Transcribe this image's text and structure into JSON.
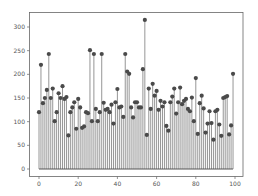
{
  "chart_data": {
    "type": "stem",
    "title": "",
    "xlabel": "",
    "ylabel": "",
    "xlim": [
      -4,
      104
    ],
    "ylim": [
      -15,
      330
    ],
    "xticks": [
      0,
      20,
      40,
      60,
      80,
      100
    ],
    "yticks": [
      0,
      50,
      100,
      150,
      200,
      250,
      300
    ],
    "grid": false,
    "legend": null,
    "baseline": 0,
    "x": [
      0,
      1,
      2,
      3,
      4,
      5,
      6,
      7,
      8,
      9,
      10,
      11,
      12,
      13,
      14,
      15,
      16,
      17,
      18,
      19,
      20,
      21,
      22,
      23,
      24,
      25,
      26,
      27,
      28,
      29,
      30,
      31,
      32,
      33,
      34,
      35,
      36,
      37,
      38,
      39,
      40,
      41,
      42,
      43,
      44,
      45,
      46,
      47,
      48,
      49,
      50,
      51,
      52,
      53,
      54,
      55,
      56,
      57,
      58,
      59,
      60,
      61,
      62,
      63,
      64,
      65,
      66,
      67,
      68,
      69,
      70,
      71,
      72,
      73,
      74,
      75,
      76,
      77,
      78,
      79,
      80,
      81,
      82,
      83,
      84,
      85,
      86,
      87,
      88,
      89,
      90,
      91,
      92,
      93,
      94,
      95,
      96,
      97,
      98,
      99
    ],
    "values": [
      120,
      220,
      139,
      150,
      167,
      243,
      150,
      170,
      101,
      120,
      160,
      150,
      175,
      148,
      152,
      71,
      120,
      130,
      141,
      85,
      148,
      130,
      87,
      90,
      120,
      118,
      251,
      101,
      243,
      127,
      101,
      120,
      243,
      140,
      125,
      127,
      120,
      136,
      96,
      141,
      169,
      130,
      132,
      110,
      243,
      206,
      201,
      130,
      109,
      141,
      141,
      130,
      130,
      211,
      315,
      72,
      170,
      127,
      180,
      155,
      165,
      125,
      144,
      132,
      141,
      91,
      81,
      141,
      153,
      170,
      117,
      141,
      172,
      137,
      144,
      148,
      127,
      122,
      151,
      101,
      192,
      74,
      139,
      155,
      128,
      77,
      96,
      122,
      97,
      62,
      122,
      125,
      94,
      70,
      150,
      152,
      154,
      73,
      92,
      201
    ],
    "colors": {
      "stem": "#8a8a8a",
      "marker": "#4a4a4a",
      "baseline": "#555555",
      "frame": "#666666",
      "tick_text": "#555555"
    }
  }
}
